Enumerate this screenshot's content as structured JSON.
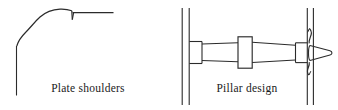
{
  "figure": {
    "width": 338,
    "height": 110,
    "background_color": "#ffffff",
    "ink_color": "#2b2b2b",
    "panels": [
      {
        "id": "plate-shoulders",
        "caption": "Plate shoulders",
        "description": "Ogee S-curve profile rising from a vertical stem to a horizontal top edge with a small downward notch at the junction"
      },
      {
        "id": "pillar-design",
        "caption": "Pillar design",
        "description": "Tapered pillar spanning between two plates, with three collars and a conical threaded nut at the right plate"
      }
    ]
  },
  "captions": {
    "left": "Plate shoulders",
    "right": "Pillar design"
  },
  "icons": {
    "ogee-curve": "ogee-curve-icon",
    "notch": "notch-icon",
    "pillar-shaft": "pillar-shaft-icon",
    "collar": "collar-icon",
    "plate": "plate-icon",
    "thread-nut": "thread-nut-icon"
  }
}
